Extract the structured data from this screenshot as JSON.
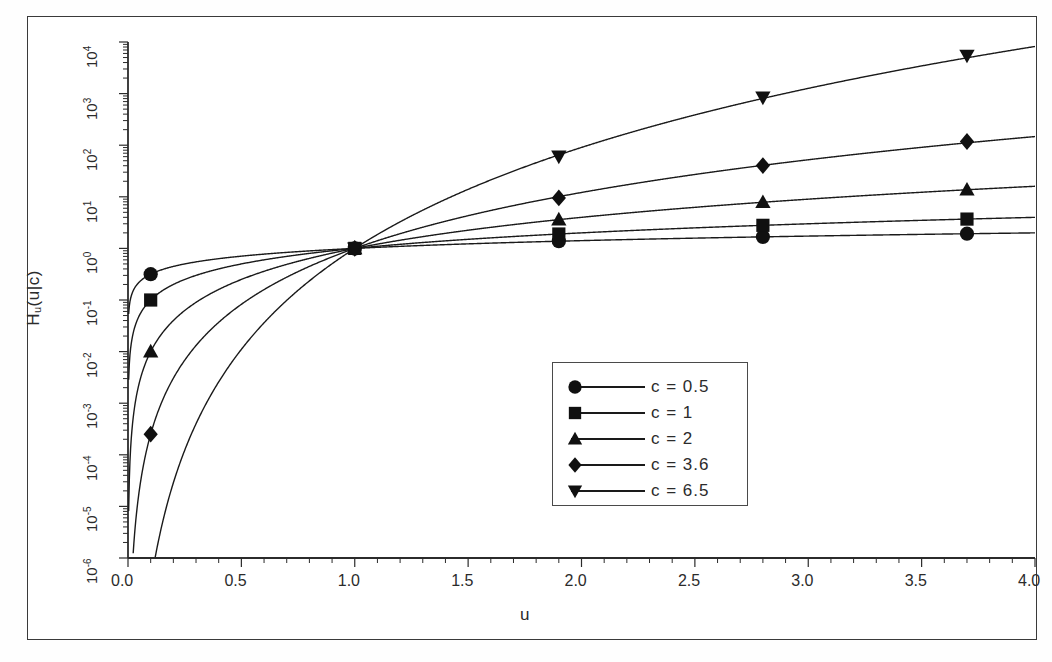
{
  "chart_data": {
    "type": "line",
    "title": "",
    "xlabel": "u",
    "ylabel": "H_u(u|c)",
    "ylabel_base": "H",
    "ylabel_sub": "u",
    "ylabel_rest": "(u|c)",
    "yscale": "log",
    "xscale": "linear",
    "xlim": [
      0.0,
      4.0
    ],
    "ylim": [
      1e-06,
      10000.0
    ],
    "grid": false,
    "legend_position": "center-right-lower",
    "xticks": [
      "0.0",
      "0.5",
      "1.0",
      "1.5",
      "2.0",
      "2.5",
      "3.0",
      "3.5",
      "4.0"
    ],
    "xtick_values": [
      0.0,
      0.5,
      1.0,
      1.5,
      2.0,
      2.5,
      3.0,
      3.5,
      4.0
    ],
    "yticks": [
      "10-6",
      "10-5",
      "10-4",
      "10-3",
      "10-2",
      "10-1",
      "100",
      "101",
      "102",
      "103",
      "104"
    ],
    "ytick_mantissa": "10",
    "ytick_exponents": [
      "-6",
      "-5",
      "-4",
      "-3",
      "-2",
      "-1",
      "0",
      "1",
      "2",
      "3",
      "4"
    ],
    "ytick_values": [
      1e-06,
      1e-05,
      0.0001,
      0.001,
      0.01,
      0.1,
      1,
      10,
      100,
      1000,
      10000
    ],
    "function": "H_u(u|c) = u^c",
    "marker_x": [
      0.1,
      1.0,
      1.9,
      2.8,
      3.7
    ],
    "series": [
      {
        "name": "c = 0.5",
        "c": 0.5,
        "marker": "circle",
        "x": [
          0.1,
          1.0,
          1.9,
          2.8,
          3.7
        ],
        "values": [
          0.316,
          1.0,
          1.378,
          1.673,
          1.924
        ]
      },
      {
        "name": "c = 1",
        "c": 1,
        "marker": "square",
        "x": [
          0.1,
          1.0,
          1.9,
          2.8,
          3.7
        ],
        "values": [
          0.1,
          1.0,
          1.9,
          2.8,
          3.7
        ]
      },
      {
        "name": "c = 2",
        "c": 2,
        "marker": "triangle-up",
        "x": [
          0.1,
          1.0,
          1.9,
          2.8,
          3.7
        ],
        "values": [
          0.01,
          1.0,
          3.61,
          7.84,
          13.69
        ]
      },
      {
        "name": "c = 3.6",
        "c": 3.6,
        "marker": "diamond",
        "x": [
          0.1,
          1.0,
          1.9,
          2.8,
          3.7
        ],
        "values": [
          0.000251,
          1.0,
          9.49,
          40.3,
          117.9
        ]
      },
      {
        "name": "c = 6.5",
        "c": 6.5,
        "marker": "triangle-down",
        "x": [
          0.1,
          1.0,
          1.9,
          2.8,
          3.7
        ],
        "values": [
          3.16e-07,
          1.0,
          60.8,
          847.0,
          5480.0
        ]
      }
    ],
    "legend_entries": [
      {
        "label": "c  =  0.5",
        "marker": "circle"
      },
      {
        "label": "c  =  1",
        "marker": "square"
      },
      {
        "label": "c  =  2",
        "marker": "triangle-up"
      },
      {
        "label": "c  =  3.6",
        "marker": "diamond"
      },
      {
        "label": "c  =  6.5",
        "marker": "triangle-down"
      }
    ],
    "colors": {
      "line": "#1a1a1a",
      "marker": "#101010",
      "axis": "#2b2b2b",
      "background": "#ffffff"
    }
  }
}
